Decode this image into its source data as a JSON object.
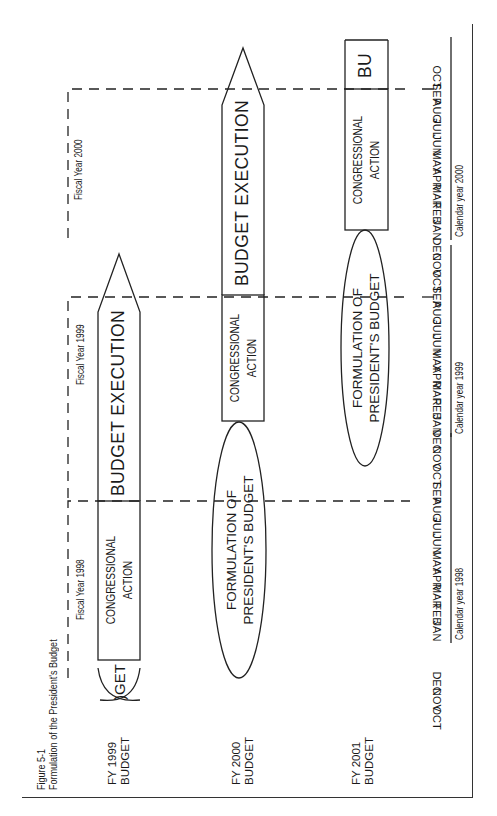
{
  "figure": {
    "number": "Figure 5-1",
    "title": "Formulation of the President's Budget"
  },
  "rows": [
    {
      "label_line1": "FY 1999",
      "label_line2": "BUDGET",
      "formulation_partial": ")GET",
      "congressional_line1": "CONGRESSIONAL",
      "congressional_line2": "ACTION",
      "execution": "BUDGET EXECUTION"
    },
    {
      "label_line1": "FY 2000",
      "label_line2": "BUDGET",
      "formulation_line1": "FORMULATION OF",
      "formulation_line2": "PRESIDENT'S BUDGET",
      "congressional_line1": "CONGRESSIONAL",
      "congressional_line2": "ACTION",
      "execution": "BUDGET EXECUTION"
    },
    {
      "label_line1": "FY 2001",
      "label_line2": "BUDGET",
      "formulation_line1": "FORMULATION OF",
      "formulation_line2": "PRESIDENT'S BUDGET",
      "congressional_line1": "CONGRESSIONAL",
      "congressional_line2": "ACTION",
      "execution_partial": "BU"
    }
  ],
  "fiscal_years": [
    "Fiscal Year 1998",
    "Fiscal Year 1999",
    "Fiscal Year 2000"
  ],
  "months": {
    "lead": [
      "OCT",
      "NOV",
      "DEC"
    ],
    "cy1998": [
      "JAN",
      "FEB",
      "MAR",
      "APR",
      "MAY",
      "JUN",
      "JUL",
      "AUG",
      "SEP",
      "OCT",
      "NOV",
      "DEC"
    ],
    "cy1999": [
      "JAN",
      "FEB",
      "MAR",
      "APR",
      "MAY",
      "JUN",
      "JUL",
      "AUG",
      "SEP",
      "OCT",
      "NOV",
      "DEC"
    ],
    "cy2000": [
      "JAN",
      "FEB",
      "MAR",
      "APR",
      "MAY",
      "JUN",
      "JUL",
      "AUG",
      "SEP",
      "OCT"
    ]
  },
  "calendar_years": [
    "Calendar year 1998",
    "Calendar year 1999",
    "Calendar year 2000"
  ]
}
